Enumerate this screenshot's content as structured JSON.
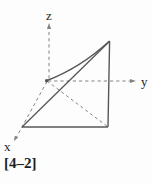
{
  "figure": {
    "caption": "[4–2]",
    "axis_labels": {
      "x": "x",
      "y": "y",
      "z": "z"
    },
    "colors": {
      "background": "#fdfdfd",
      "solid_edge": "#575757",
      "dashed_line": "#828282",
      "label_text": "#1e1e1e"
    }
  }
}
